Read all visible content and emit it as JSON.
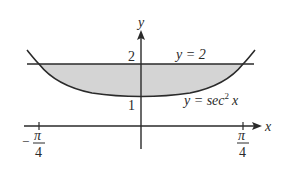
{
  "figure": {
    "axis_labels": {
      "x": "x",
      "y": "y"
    },
    "y_ticks": [
      {
        "value": 1,
        "label": "1"
      },
      {
        "value": 2,
        "label": "2"
      }
    ],
    "x_ticks": [
      {
        "value": -0.7854,
        "num": "π",
        "den": "4",
        "sign": "−"
      },
      {
        "value": 0.7854,
        "num": "π",
        "den": "4",
        "sign": ""
      }
    ],
    "curves": [
      {
        "name": "line",
        "equation_lhs": "y = 2",
        "label": "y = 2"
      },
      {
        "name": "secant-squared",
        "label_y": "y = sec",
        "label_exp": "2",
        "label_x": "x"
      }
    ],
    "shaded_region": {
      "fill": "#d4d4d4",
      "between": [
        "y = sec^2 x",
        "y = 2"
      ],
      "x_range": [
        "-π/4",
        "π/4"
      ]
    },
    "colors": {
      "ink": "#2a2a2a",
      "shade": "#d4d4d4",
      "background": "#ffffff"
    }
  }
}
